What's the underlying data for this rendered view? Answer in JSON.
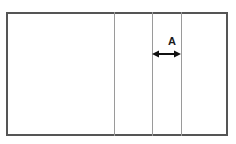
{
  "diagram": {
    "type": "technical-line-drawing",
    "canvas": {
      "width": 236,
      "height": 144,
      "background": "#ffffff"
    },
    "colors": {
      "outer_border": "#555555",
      "divider_line": "#9a9a9a",
      "arrow": "#111111",
      "label_text": "#1a1a1a"
    },
    "outer_rectangle": {
      "name": "outer-rectangle",
      "x": 6,
      "y": 12,
      "width": 222,
      "height": 124,
      "stroke_width": 2
    },
    "divider_lines": [
      {
        "name": "divider-line-1",
        "x": 114,
        "y_top": 12,
        "y_bottom": 136,
        "stroke_width": 1
      },
      {
        "name": "divider-line-2",
        "x": 152,
        "y_top": 12,
        "y_bottom": 136,
        "stroke_width": 1
      },
      {
        "name": "divider-line-3",
        "x": 181,
        "y_top": 12,
        "y_bottom": 136,
        "stroke_width": 1
      }
    ],
    "dimension": {
      "name": "dimension-a",
      "label": "A",
      "label_x": 172,
      "label_y": 36,
      "arrow": {
        "y": 54,
        "x_start": 152,
        "x_end": 181,
        "double_headed": true,
        "head_length": 7,
        "head_half_width": 3.5,
        "shaft_width": 2
      }
    }
  }
}
